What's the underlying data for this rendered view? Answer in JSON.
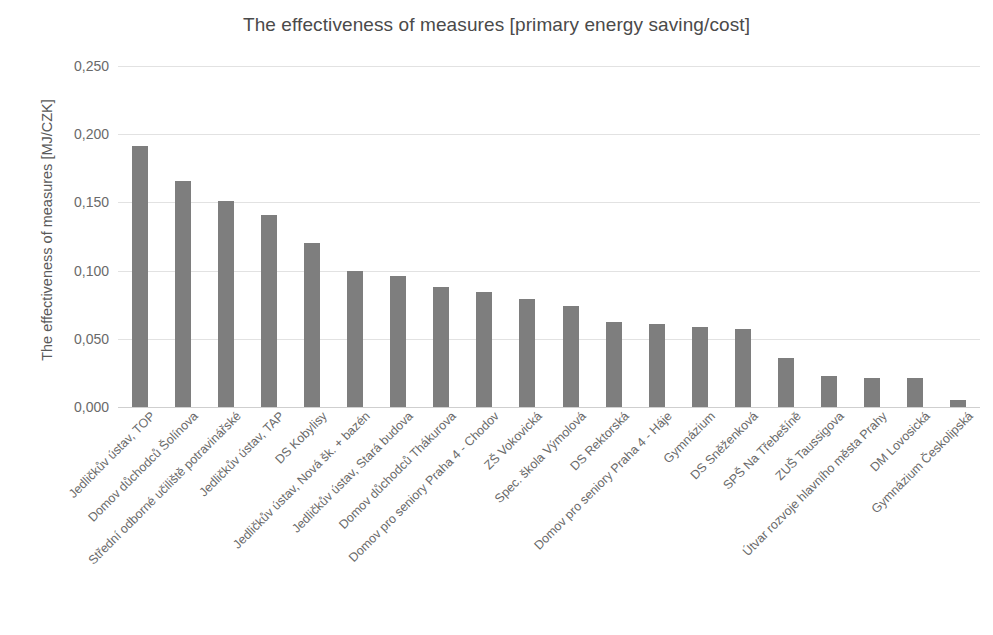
{
  "chart_data": {
    "type": "bar",
    "title": "The effectiveness of measures [primary energy saving/cost]",
    "xlabel": "",
    "ylabel": "The effectiveness of measures [MJ/CZK]",
    "ylim": [
      0.0,
      0.25
    ],
    "ytick_labels": [
      "0,250",
      "0,200",
      "0,150",
      "0,100",
      "0,050",
      "0,000"
    ],
    "ytick_values": [
      0.25,
      0.2,
      0.15,
      0.1,
      0.05,
      0.0
    ],
    "grid": true,
    "legend": "none",
    "bar_color": "#7e7e7e",
    "categories": [
      "Jedličkův ústav, TOP",
      "Domov důchodců Šolínova",
      "Střední odborné učiliště potravinářské",
      "Jedličkův ústav, TAP",
      "DS Kobylisy",
      "Jedličkův ústav, Nová šk. + bazén",
      "Jedličkův ústav, Stará budova",
      "Domov důchodců Thákurova",
      "Domov pro seniory Praha 4 - Chodov",
      "ZŠ Vokovická",
      "Spec. škola Výmolová",
      "DS Rektorská",
      "Domov pro seniory Praha 4 - Háje",
      "Gymnázium",
      "DS Sněženková",
      "SPŠ Na Třebešíně",
      "ZUŠ Taussigova",
      "Útvar rozvoje hlavního města Prahy",
      "DM Lovosická",
      "Gymnázium Českolipská"
    ],
    "values": [
      0.191,
      0.166,
      0.151,
      0.141,
      0.12,
      0.1,
      0.096,
      0.088,
      0.084,
      0.079,
      0.074,
      0.062,
      0.061,
      0.059,
      0.057,
      0.036,
      0.023,
      0.021,
      0.021,
      0.005
    ]
  }
}
